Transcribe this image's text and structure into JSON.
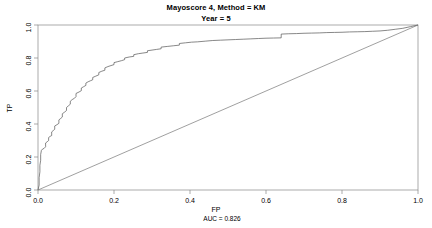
{
  "title": {
    "line1": "Mayoscore 4, Method = KM",
    "line2": "Year = 5"
  },
  "chart_data": {
    "type": "line",
    "title": "Mayoscore 4, Method = KM",
    "subtitle": "Year = 5",
    "xlabel": "FP",
    "ylabel": "TP",
    "xlim": [
      0,
      1
    ],
    "ylim": [
      0,
      1
    ],
    "grid": false,
    "legend": null,
    "annotation": "AUC = 0.826",
    "auc": 0.826,
    "xticks": [
      "0.0",
      "0.2",
      "0.4",
      "0.6",
      "0.8",
      "1.0"
    ],
    "xtick_values": [
      0.0,
      0.2,
      0.4,
      0.6,
      0.8,
      1.0
    ],
    "yticks": [
      "0.0",
      "0.2",
      "0.4",
      "0.6",
      "0.8",
      "1.0"
    ],
    "ytick_values": [
      0.0,
      0.2,
      0.4,
      0.6,
      0.8,
      1.0
    ],
    "series": [
      {
        "name": "ROC curve",
        "color": "#555555",
        "points": [
          [
            0.0,
            0.0
          ],
          [
            0.003,
            0.03
          ],
          [
            0.003,
            0.075
          ],
          [
            0.005,
            0.11
          ],
          [
            0.005,
            0.15
          ],
          [
            0.007,
            0.18
          ],
          [
            0.007,
            0.215
          ],
          [
            0.009,
            0.24
          ],
          [
            0.012,
            0.248
          ],
          [
            0.016,
            0.252
          ],
          [
            0.02,
            0.262
          ],
          [
            0.02,
            0.285
          ],
          [
            0.024,
            0.292
          ],
          [
            0.028,
            0.3
          ],
          [
            0.028,
            0.318
          ],
          [
            0.032,
            0.325
          ],
          [
            0.036,
            0.33
          ],
          [
            0.036,
            0.352
          ],
          [
            0.04,
            0.36
          ],
          [
            0.044,
            0.368
          ],
          [
            0.044,
            0.388
          ],
          [
            0.05,
            0.396
          ],
          [
            0.055,
            0.404
          ],
          [
            0.055,
            0.425
          ],
          [
            0.06,
            0.434
          ],
          [
            0.064,
            0.442
          ],
          [
            0.064,
            0.462
          ],
          [
            0.07,
            0.472
          ],
          [
            0.075,
            0.482
          ],
          [
            0.075,
            0.5
          ],
          [
            0.08,
            0.51
          ],
          [
            0.085,
            0.52
          ],
          [
            0.085,
            0.538
          ],
          [
            0.09,
            0.548
          ],
          [
            0.096,
            0.556
          ],
          [
            0.1,
            0.566
          ],
          [
            0.1,
            0.585
          ],
          [
            0.108,
            0.594
          ],
          [
            0.114,
            0.602
          ],
          [
            0.114,
            0.618
          ],
          [
            0.12,
            0.626
          ],
          [
            0.126,
            0.634
          ],
          [
            0.126,
            0.648
          ],
          [
            0.132,
            0.656
          ],
          [
            0.138,
            0.662
          ],
          [
            0.144,
            0.668
          ],
          [
            0.144,
            0.682
          ],
          [
            0.152,
            0.69
          ],
          [
            0.16,
            0.698
          ],
          [
            0.16,
            0.712
          ],
          [
            0.168,
            0.72
          ],
          [
            0.176,
            0.726
          ],
          [
            0.176,
            0.74
          ],
          [
            0.184,
            0.748
          ],
          [
            0.192,
            0.754
          ],
          [
            0.2,
            0.76
          ],
          [
            0.2,
            0.772
          ],
          [
            0.21,
            0.778
          ],
          [
            0.22,
            0.784
          ],
          [
            0.228,
            0.79
          ],
          [
            0.228,
            0.8
          ],
          [
            0.24,
            0.806
          ],
          [
            0.252,
            0.81
          ],
          [
            0.252,
            0.82
          ],
          [
            0.264,
            0.826
          ],
          [
            0.276,
            0.83
          ],
          [
            0.288,
            0.834
          ],
          [
            0.288,
            0.844
          ],
          [
            0.3,
            0.848
          ],
          [
            0.312,
            0.852
          ],
          [
            0.324,
            0.856
          ],
          [
            0.324,
            0.866
          ],
          [
            0.34,
            0.87
          ],
          [
            0.356,
            0.874
          ],
          [
            0.372,
            0.878
          ],
          [
            0.372,
            0.888
          ],
          [
            0.388,
            0.892
          ],
          [
            0.404,
            0.896
          ],
          [
            0.42,
            0.898
          ],
          [
            0.44,
            0.902
          ],
          [
            0.46,
            0.906
          ],
          [
            0.48,
            0.908
          ],
          [
            0.5,
            0.91
          ],
          [
            0.52,
            0.912
          ],
          [
            0.54,
            0.914
          ],
          [
            0.56,
            0.916
          ],
          [
            0.58,
            0.918
          ],
          [
            0.6,
            0.92
          ],
          [
            0.62,
            0.921
          ],
          [
            0.64,
            0.922
          ],
          [
            0.64,
            0.945
          ],
          [
            0.66,
            0.947
          ],
          [
            0.68,
            0.948
          ],
          [
            0.7,
            0.95
          ],
          [
            0.72,
            0.951
          ],
          [
            0.74,
            0.952
          ],
          [
            0.76,
            0.954
          ],
          [
            0.78,
            0.955
          ],
          [
            0.8,
            0.956
          ],
          [
            0.82,
            0.958
          ],
          [
            0.84,
            0.959
          ],
          [
            0.86,
            0.96
          ],
          [
            0.88,
            0.962
          ],
          [
            0.9,
            0.964
          ],
          [
            0.92,
            0.968
          ],
          [
            0.94,
            0.974
          ],
          [
            0.96,
            0.98
          ],
          [
            0.98,
            0.99
          ],
          [
            1.0,
            1.0
          ]
        ]
      },
      {
        "name": "Reference diagonal",
        "color": "#777777",
        "points": [
          [
            0.0,
            0.0
          ],
          [
            1.0,
            1.0
          ]
        ]
      }
    ]
  },
  "axes": {
    "x_title": "FP",
    "y_title": "TP",
    "auc_text": "AUC = 0.826"
  },
  "colors": {
    "axis": "#888888",
    "curve": "#555555",
    "diagonal": "#777777",
    "text": "#000000",
    "background": "#ffffff"
  }
}
